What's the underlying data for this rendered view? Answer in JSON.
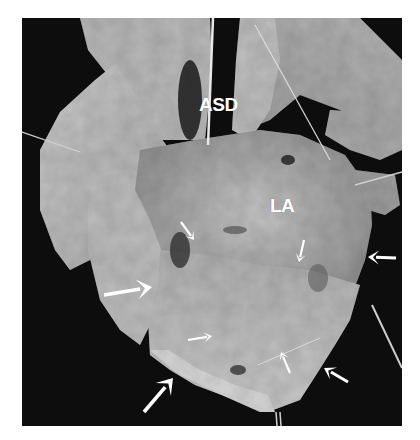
{
  "figure": {
    "type": "grayscale anatomical photograph",
    "background_color": "#0d0d0d",
    "labels": [
      {
        "id": "asd",
        "text": "ASD",
        "x": 199,
        "y": 95
      },
      {
        "id": "la",
        "text": "LA",
        "x": 270,
        "y": 196
      }
    ],
    "arrows": [
      {
        "id": "arrow-upper-left-wall",
        "x1": 181,
        "y1": 222,
        "x2": 194,
        "y2": 240,
        "size": "small"
      },
      {
        "id": "arrow-upper-right-wall",
        "x1": 304,
        "y1": 240,
        "x2": 299,
        "y2": 262,
        "size": "small"
      },
      {
        "id": "arrow-right-edge",
        "x1": 396,
        "y1": 258,
        "x2": 368,
        "y2": 257,
        "size": "medium"
      },
      {
        "id": "arrow-left-mid",
        "x1": 104,
        "y1": 295,
        "x2": 152,
        "y2": 287,
        "size": "large"
      },
      {
        "id": "arrow-center-lower",
        "x1": 188,
        "y1": 340,
        "x2": 212,
        "y2": 336,
        "size": "small"
      },
      {
        "id": "arrow-lower-right-inner",
        "x1": 290,
        "y1": 373,
        "x2": 281,
        "y2": 352,
        "size": "small"
      },
      {
        "id": "arrow-lower-right-edge",
        "x1": 348,
        "y1": 382,
        "x2": 324,
        "y2": 368,
        "size": "medium"
      },
      {
        "id": "arrow-bottom-left",
        "x1": 144,
        "y1": 412,
        "x2": 173,
        "y2": 378,
        "size": "large"
      }
    ]
  }
}
